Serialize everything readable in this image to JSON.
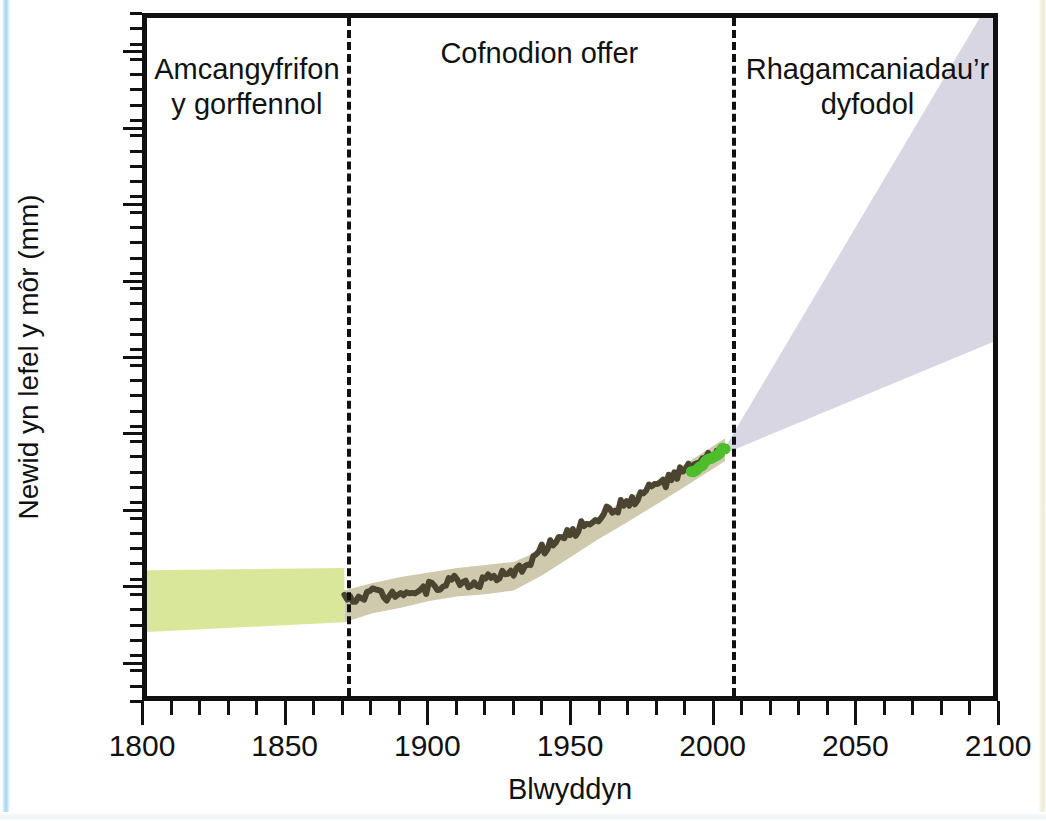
{
  "chart_data": {
    "type": "area",
    "title": "",
    "xlabel": "Blwyddyn",
    "ylabel": "Newid yn lefel y môr (mm)",
    "xlim": [
      1800,
      2100
    ],
    "ylim": [
      -250,
      650
    ],
    "grid": false,
    "legend": "none",
    "xticks": [
      1800,
      1850,
      1900,
      1950,
      2000,
      2050,
      2100
    ],
    "xtick_labels": [
      "1800",
      "1850",
      "1900",
      "1950",
      "2000",
      "2050",
      "2100"
    ],
    "x_minor_step": 10,
    "yticks": [
      600,
      500,
      400,
      300,
      200,
      100,
      0,
      -100,
      -200
    ],
    "ytick_labels": [
      "600",
      "500",
      "600",
      "300",
      "200",
      "100",
      "00",
      "−100",
      "−200"
    ],
    "y_minor_step": 20,
    "era_dividers": [
      1870,
      2005
    ],
    "annotations": [
      {
        "name": "past-estimates",
        "text": "Amcangyfrifon y gorffennol",
        "x_range": [
          1800,
          1870
        ],
        "y": 580
      },
      {
        "name": "instrumental-record",
        "text": "Cofnodion offer",
        "x_range": [
          1870,
          2005
        ],
        "y": 600
      },
      {
        "name": "future-projections",
        "text": "Rhagamcaniadau’r dyfodol",
        "x_range": [
          2005,
          2100
        ],
        "y": 580
      }
    ],
    "series": [
      {
        "name": "past-estimates-band",
        "kind": "band",
        "color": "#d9e79a",
        "x": [
          1800,
          1870
        ],
        "lower": [
          -165,
          -152
        ],
        "upper": [
          -83,
          -80
        ]
      },
      {
        "name": "tide-gauge-uncertainty-band",
        "kind": "band",
        "color": "#cfc9ad",
        "x": [
          1870,
          1880,
          1890,
          1900,
          1910,
          1920,
          1930,
          1940,
          1950,
          1960,
          1970,
          1980,
          1990,
          2000,
          2005
        ],
        "lower": [
          -152,
          -140,
          -133,
          -124,
          -118,
          -115,
          -110,
          -90,
          -66,
          -42,
          -20,
          3,
          26,
          50,
          62
        ],
        "upper": [
          -110,
          -100,
          -92,
          -86,
          -80,
          -76,
          -72,
          -56,
          -34,
          -12,
          11,
          33,
          56,
          80,
          92
        ]
      },
      {
        "name": "tide-gauge-record",
        "kind": "line",
        "color": "#4a4431",
        "x": [
          1870,
          1875,
          1880,
          1885,
          1890,
          1895,
          1900,
          1905,
          1910,
          1915,
          1920,
          1925,
          1930,
          1935,
          1940,
          1945,
          1950,
          1955,
          1960,
          1965,
          1970,
          1975,
          1980,
          1985,
          1990,
          1995,
          2000,
          2003
        ],
        "y": [
          -122,
          -116,
          -112,
          -118,
          -108,
          -112,
          -106,
          -100,
          -96,
          -102,
          -95,
          -92,
          -90,
          -72,
          -56,
          -44,
          -36,
          -22,
          -12,
          -2,
          6,
          16,
          30,
          36,
          48,
          56,
          68,
          74
        ]
      },
      {
        "name": "satellite-altimeter-record",
        "kind": "line",
        "color": "#4dbd2c",
        "x": [
          1993,
          1996,
          1999,
          2002,
          2005
        ],
        "y": [
          45,
          54,
          62,
          70,
          78
        ]
      },
      {
        "name": "future-projection-wedge",
        "kind": "band",
        "color": "#d9d6e4",
        "x": [
          2005,
          2100
        ],
        "lower": [
          72,
          220
        ],
        "upper": [
          80,
          680
        ]
      }
    ]
  }
}
